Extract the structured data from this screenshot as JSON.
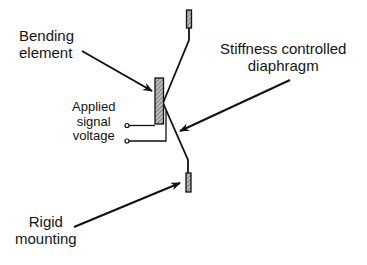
{
  "diagram": {
    "type": "cross-section schematic",
    "labels": {
      "bending_element": [
        "Bending",
        "element"
      ],
      "stiffness_diaphragm": [
        "Stiffness controlled",
        "diaphragm"
      ],
      "applied_voltage": [
        "Applied",
        "signal",
        "voltage"
      ],
      "rigid_mounting": [
        "Rigid",
        "mounting"
      ]
    },
    "components": [
      {
        "id": "top-mount",
        "desc": "hatched rigid mounting block (top)"
      },
      {
        "id": "bottom-mount",
        "desc": "hatched rigid mounting block (bottom)"
      },
      {
        "id": "bending-element",
        "desc": "hatched bending element bar"
      },
      {
        "id": "diaphragm",
        "desc": "stiffness controlled diaphragm, V-shaped line between mounts"
      },
      {
        "id": "signal-terminals",
        "desc": "two wire terminals with leads to bending element"
      }
    ],
    "arrows": [
      {
        "from": "bending_element label",
        "to": "bending-element"
      },
      {
        "from": "stiffness_diaphragm label",
        "to": "diaphragm"
      },
      {
        "from": "rigid_mounting label",
        "to": "bottom-mount"
      }
    ],
    "colors": {
      "line": "#111111",
      "hatch_fill": "#9a9a9a",
      "background": "#ffffff"
    }
  }
}
